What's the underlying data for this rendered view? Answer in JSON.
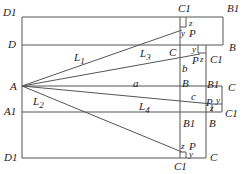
{
  "diagram": {
    "type": "geometric construction",
    "stroke_color": "#555555",
    "labels": {
      "D1_top": "D1",
      "D": "D",
      "A": "A",
      "A1": "A1",
      "D1_bottom": "D1",
      "L1": "L",
      "L1_sub": "1",
      "L2": "L",
      "L2_sub": "2",
      "L3": "L",
      "L3_sub": "3",
      "L4": "L",
      "L4_sub": "4",
      "a": "a",
      "b": "b",
      "c": "c",
      "top_C1": "C1",
      "top_B1": "B1",
      "top_z": "z",
      "top_y": "y",
      "top_P": "P",
      "B_right": "B",
      "mid_C": "C",
      "mid_y": "y",
      "mid_P": "P",
      "mid_z": "z",
      "mid_C1": "C1",
      "B_lower": "B",
      "B1_right": "B1",
      "C_right": "C",
      "low_P": "P",
      "low_y": "y",
      "low_z": "z",
      "low_C1": "C1",
      "B1_lower": "B1",
      "B_lower2": "B",
      "bot_z": "z",
      "bot_P": "P",
      "bot_y": "y",
      "bot_C1": "C1",
      "bot_C": "C"
    }
  }
}
